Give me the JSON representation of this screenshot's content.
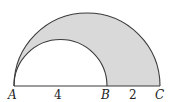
{
  "diagram": {
    "points": [
      {
        "id": "A",
        "label": "A",
        "x": 14
      },
      {
        "id": "B",
        "label": "B",
        "x": 107
      },
      {
        "id": "C",
        "label": "C",
        "x": 160
      }
    ],
    "segments": [
      {
        "from": "A",
        "to": "B",
        "length_label": "4"
      },
      {
        "from": "B",
        "to": "C",
        "length_label": "2"
      }
    ],
    "shapes": [
      {
        "type": "semicircle",
        "diameter": "AC",
        "role": "outer"
      },
      {
        "type": "semicircle",
        "diameter": "AB",
        "role": "inner"
      }
    ],
    "shaded_region": "outer semicircle minus inner semicircle",
    "colors": {
      "shading": "#d9d9d9",
      "stroke": "#3a3a3a",
      "background": "#ffffff"
    }
  }
}
